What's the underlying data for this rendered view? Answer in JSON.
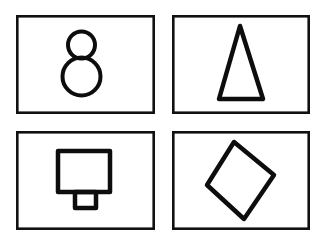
{
  "document": {
    "title": "Four framed line-drawing shapes",
    "background_color": "#ffffff",
    "ink_color": "#0d0d0d",
    "frame_color": "#111111",
    "canvas": {
      "width": 324,
      "height": 240
    },
    "layout": "2x2 grid of bordered panels"
  },
  "panels": [
    {
      "id": "panel-top-left",
      "position": "top-left",
      "frame": {
        "x": 16,
        "y": 15,
        "width": 139,
        "height": 99,
        "stroke_width": 2.6
      },
      "shape": {
        "name": "snowman",
        "description": "Two stacked circles: a small circle above a larger circle",
        "stroke_width": 4,
        "parts": [
          {
            "type": "circle",
            "name": "head-circle",
            "cx": 81.5,
            "cy": 45,
            "r": 13.5
          },
          {
            "type": "circle",
            "name": "body-circle",
            "cx": 81.5,
            "cy": 76.5,
            "r": 19
          }
        ]
      }
    },
    {
      "id": "panel-top-right",
      "position": "top-right",
      "frame": {
        "x": 172,
        "y": 15,
        "width": 138,
        "height": 99,
        "stroke_width": 2.6
      },
      "shape": {
        "name": "triangle",
        "description": "Narrow tall isosceles triangle pointing up",
        "stroke_width": 4.5,
        "parts": [
          {
            "type": "polygon",
            "name": "isosceles-triangle",
            "points": "240,26 263,99 219,99"
          }
        ]
      }
    },
    {
      "id": "panel-bottom-left",
      "position": "bottom-left",
      "frame": {
        "x": 16,
        "y": 131,
        "width": 139,
        "height": 99,
        "stroke_width": 2.6
      },
      "shape": {
        "name": "square-with-tab",
        "description": "Large square with a small rectangular tab attached beneath it",
        "stroke_width": 4.5,
        "parts": [
          {
            "type": "rect",
            "name": "large-square",
            "x": 58,
            "y": 151,
            "width": 52,
            "height": 41
          },
          {
            "type": "rect",
            "name": "small-tab-square",
            "x": 75,
            "y": 192,
            "width": 21,
            "height": 16
          }
        ]
      }
    },
    {
      "id": "panel-bottom-right",
      "position": "bottom-right",
      "frame": {
        "x": 172,
        "y": 131,
        "width": 138,
        "height": 99,
        "stroke_width": 2.6
      },
      "shape": {
        "name": "diamond",
        "description": "Square rotated roughly 45 degrees, slightly tilted",
        "stroke_width": 4.5,
        "parts": [
          {
            "type": "polygon",
            "name": "rotated-square-diamond",
            "points": "234,142 274,175 244,219 207,185"
          }
        ]
      }
    }
  ]
}
